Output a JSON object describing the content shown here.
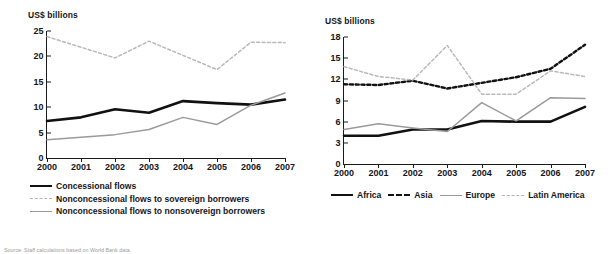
{
  "figure": {
    "source_note": "Source: Staff calculations based on World Bank data."
  },
  "chart_data": [
    {
      "id": "left",
      "type": "line",
      "title": "",
      "ylabel": "US$ billions",
      "xlabel": "",
      "ylim": [
        0,
        25
      ],
      "yticks": [
        0,
        5,
        10,
        15,
        20,
        25
      ],
      "grid": false,
      "legend_position": "below",
      "categories": [
        "2000",
        "2001",
        "2002",
        "2003",
        "2004",
        "2005",
        "2006",
        "2007"
      ],
      "series": [
        {
          "name": "Concessional flows",
          "style": "solid-black",
          "values": [
            7.3,
            8.0,
            9.6,
            8.9,
            11.2,
            10.8,
            10.5,
            11.5
          ]
        },
        {
          "name": "Nonconcessional flows to sovereign borrowers",
          "style": "dotted-gray",
          "values": [
            23.9,
            21.8,
            19.7,
            23.0,
            20.2,
            17.4,
            22.8,
            22.7
          ]
        },
        {
          "name": "Nonconcessional flows to nonsovereign borrowers",
          "style": "solid-gray",
          "values": [
            3.6,
            4.1,
            4.6,
            5.6,
            8.0,
            6.6,
            10.4,
            12.8
          ]
        }
      ]
    },
    {
      "id": "right",
      "type": "line",
      "title": "",
      "ylabel": "US$ billions",
      "xlabel": "",
      "ylim": [
        0,
        18
      ],
      "yticks": [
        0,
        3,
        6,
        9,
        12,
        15,
        18
      ],
      "grid": false,
      "legend_position": "below",
      "categories": [
        "2000",
        "2001",
        "2002",
        "2003",
        "2004",
        "2005",
        "2006",
        "2007"
      ],
      "series": [
        {
          "name": "Africa",
          "style": "solid-black",
          "values": [
            4.0,
            4.0,
            4.9,
            4.9,
            6.1,
            6.0,
            6.0,
            8.1
          ]
        },
        {
          "name": "Asia",
          "style": "dashed-black",
          "values": [
            11.3,
            11.2,
            11.8,
            10.7,
            11.5,
            12.3,
            13.5,
            16.9
          ]
        },
        {
          "name": "Europe",
          "style": "solid-gray",
          "values": [
            4.9,
            5.7,
            5.1,
            4.6,
            8.7,
            6.1,
            9.4,
            9.3
          ]
        },
        {
          "name": "Latin America",
          "style": "dotted-gray",
          "values": [
            13.8,
            12.4,
            11.9,
            16.8,
            9.9,
            9.9,
            13.2,
            12.4
          ]
        }
      ]
    }
  ]
}
